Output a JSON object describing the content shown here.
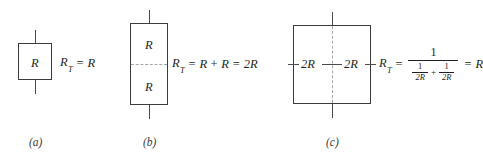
{
  "figure": {
    "panels": [
      {
        "id": "a",
        "caption": "(a)",
        "resistor_labels": [
          "R"
        ],
        "equation": {
          "lhs": "R",
          "lhs_subscript": "T",
          "equals": "=",
          "rhs": "R"
        }
      },
      {
        "id": "b",
        "caption": "(b)",
        "resistor_labels": [
          "R",
          "R"
        ],
        "equation": {
          "lhs": "R",
          "lhs_subscript": "T",
          "equals": "=",
          "term1": "R",
          "plus": "+",
          "term2": "R",
          "equals2": "=",
          "result": "2R"
        }
      },
      {
        "id": "c",
        "caption": "(c)",
        "resistor_labels": [
          "2R",
          "2R"
        ],
        "equation": {
          "lhs": "R",
          "lhs_subscript": "T",
          "equals": "=",
          "numerator": "1",
          "denom_frac1_num": "1",
          "denom_frac1_den": "2R",
          "denom_plus": "+",
          "denom_frac2_num": "1",
          "denom_frac2_den": "2R",
          "equals2": "=",
          "result": "R"
        }
      }
    ]
  },
  "colors": {
    "background": "#ffffff",
    "box_border": "#3b3b3b",
    "lead": "#4a4a4a",
    "dashed_divider": "#a6a6a6",
    "text": "#231f20"
  }
}
